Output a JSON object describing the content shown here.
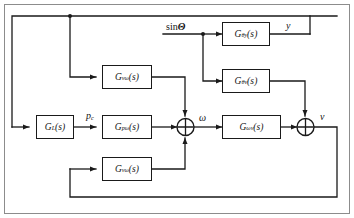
{
  "figure": {
    "type": "control-block-diagram",
    "title": "",
    "border": true,
    "line_color": "#1a1a1a",
    "background": "#ffffff"
  },
  "inputs": [
    {
      "name": "sin-theta-input",
      "label_prefix": "sin",
      "label_symbol": "Θ",
      "label": "sinΘ"
    }
  ],
  "outputs": [
    {
      "name": "y-output",
      "label": "y"
    },
    {
      "name": "v-output",
      "label": "v"
    }
  ],
  "signals": [
    {
      "name": "pc-signal",
      "base": "p",
      "sub": "c",
      "label": "p"
    },
    {
      "name": "omega-signal",
      "label": "ω"
    },
    {
      "name": "v-signal",
      "label": "v"
    },
    {
      "name": "y-signal",
      "label": "y"
    }
  ],
  "blocks": [
    {
      "id": "g-theta-y",
      "name": "transfer-block-g-theta-y",
      "base": "G",
      "sub": "θy",
      "arg": "(s)",
      "label": "Gθy(s)"
    },
    {
      "id": "g-theta-v",
      "name": "transfer-block-g-theta-v",
      "base": "G",
      "sub": "θv",
      "arg": "(s)",
      "label": "Gθv(s)"
    },
    {
      "id": "g-omega-v",
      "name": "transfer-block-g-omega-v",
      "base": "G",
      "sub": "ωv",
      "arg": "(s)",
      "label": "Gωv(s)"
    },
    {
      "id": "g-l",
      "name": "transfer-block-g-l",
      "base": "G",
      "sub": "L",
      "arg": "(s)",
      "label": "GL(s)"
    },
    {
      "id": "g-v-omega-top",
      "name": "transfer-block-g-v-omega-top",
      "base": "G",
      "sub": "vω",
      "arg": "(s)",
      "label": "Gvω(s)"
    },
    {
      "id": "g-p-omega",
      "name": "transfer-block-g-p-omega",
      "base": "G",
      "sub": "pω",
      "arg": "(s)",
      "label": "Gpω(s)"
    },
    {
      "id": "g-v-omega-bottom",
      "name": "transfer-block-g-v-omega-bottom",
      "base": "G",
      "sub": "vω",
      "arg": "(s)",
      "label": "Gvω(s)"
    }
  ],
  "junctions": [
    {
      "id": "sum-1",
      "name": "summing-junction-omega",
      "symbol": "⊕"
    },
    {
      "id": "sum-2",
      "name": "summing-junction-v",
      "symbol": "⊕"
    }
  ],
  "branch_points": [
    {
      "id": "branch-theta",
      "name": "branch-point-sin-theta"
    },
    {
      "id": "branch-top-rail",
      "name": "branch-point-top-feedback"
    }
  ]
}
